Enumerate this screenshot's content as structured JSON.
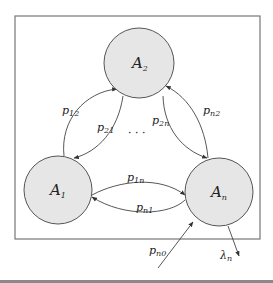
{
  "diagram": {
    "type": "state-transition-graph",
    "colors": {
      "node_fill": "#e6e6e6",
      "stroke": "#444444",
      "frame": "#777777",
      "bottom_bar": "#8a8a8a"
    },
    "nodes": [
      {
        "id": "A1",
        "base": "A",
        "sub": "1"
      },
      {
        "id": "A2",
        "base": "A",
        "sub": "2"
      },
      {
        "id": "An",
        "base": "A",
        "sub": "n"
      }
    ],
    "edges": [
      {
        "from": "A1",
        "to": "A2",
        "base": "p",
        "sub": "12"
      },
      {
        "from": "A2",
        "to": "A1",
        "base": "p",
        "sub": "21"
      },
      {
        "from": "A2",
        "to": "An",
        "base": "p",
        "sub": "2n"
      },
      {
        "from": "An",
        "to": "A2",
        "base": "p",
        "sub": "n2"
      },
      {
        "from": "A1",
        "to": "An",
        "base": "p",
        "sub": "1n"
      },
      {
        "from": "An",
        "to": "A1",
        "base": "p",
        "sub": "n1"
      },
      {
        "from": "external",
        "to": "An",
        "base": "p",
        "sub": "n0"
      },
      {
        "from": "An",
        "to": "external",
        "base": "λ",
        "sub": "n"
      }
    ],
    "ellipsis": "· · ·"
  }
}
